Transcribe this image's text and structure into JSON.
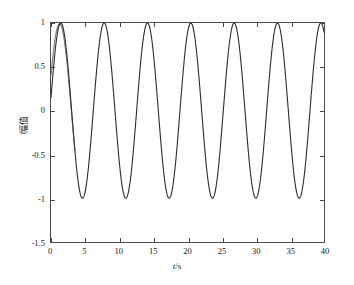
{
  "chart_data": {
    "type": "line",
    "title": "",
    "xlabel": "t/s",
    "ylabel": "幅值",
    "xlim": [
      0,
      40
    ],
    "ylim": [
      -1.5,
      1
    ],
    "grid": false,
    "legend": "none",
    "xticks": [
      0,
      5,
      10,
      15,
      20,
      25,
      30,
      35,
      40
    ],
    "xtick_labels": [
      "0",
      "5",
      "10",
      "15",
      "20",
      "25",
      "30",
      "35",
      "40"
    ],
    "yticks": [
      1,
      0.5,
      0,
      -0.5,
      -1,
      -1.5
    ],
    "ytick_labels": [
      "1",
      "0.5",
      "0",
      "-0.5",
      "-1",
      "-1.5"
    ],
    "line_color": "#2b2b2b",
    "line_width": 1.1,
    "background": "#ffffff",
    "axis_color": "#4a4a4a",
    "series": [
      {
        "name": "signal-primary",
        "kind": "sinusoid",
        "amplitude": 1.0,
        "period_s": 6.35,
        "phase_rad": 0.15,
        "offset": 0.0,
        "t_start": 0.0,
        "t_end": 40.0,
        "y_at_t0": 0.15,
        "peaks_t": [
          1.5,
          7.9,
          14.2,
          20.6,
          26.9,
          33.3,
          39.6
        ],
        "peaks_y": [
          1,
          1,
          1,
          1,
          1,
          1,
          1
        ],
        "troughs_t": [
          4.7,
          11.1,
          17.4,
          23.8,
          30.1,
          36.5
        ],
        "troughs_y": [
          -1,
          -1,
          -1,
          -1,
          -1,
          -1
        ]
      },
      {
        "name": "signal-overlay",
        "kind": "sinusoid",
        "amplitude": 1.0,
        "period_s": 6.35,
        "phase_rad": 0.42,
        "offset": 0.0,
        "t_start": 0.0,
        "t_end": 40.0,
        "y_at_t0": 0.42,
        "converges_after_t": 3.5,
        "note": "near-duplicate trace, visibly separate only for t<3.5"
      }
    ]
  },
  "axes": {
    "x_title": "t/s",
    "x_title_italic_part": "t",
    "x_title_rest": "/s",
    "y_title": "幅值"
  }
}
